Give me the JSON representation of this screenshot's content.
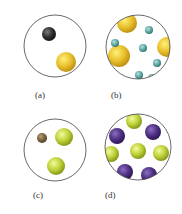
{
  "panels": [
    {
      "label": "(a)",
      "circle": {
        "cx": 55,
        "cy": 46,
        "r": 31
      },
      "label_pos": {
        "x": 35,
        "y": 98
      },
      "particles": [
        {
          "cx": 49,
          "cy": 34,
          "r": 7,
          "color": "dark"
        },
        {
          "cx": 66,
          "cy": 62,
          "r": 10,
          "color": "gold"
        }
      ]
    },
    {
      "label": "(b)",
      "circle": {
        "cx": 138,
        "cy": 47,
        "r": 32
      },
      "label_pos": {
        "x": 111,
        "y": 98
      },
      "particles": [
        {
          "cx": 127,
          "cy": 23,
          "r": 10,
          "color": "gold"
        },
        {
          "cx": 119,
          "cy": 56,
          "r": 11,
          "color": "gold"
        },
        {
          "cx": 167,
          "cy": 47,
          "r": 10,
          "color": "gold"
        },
        {
          "cx": 149,
          "cy": 30,
          "r": 4,
          "color": "teal"
        },
        {
          "cx": 115,
          "cy": 43,
          "r": 4,
          "color": "teal"
        },
        {
          "cx": 143,
          "cy": 48,
          "r": 4,
          "color": "teal"
        },
        {
          "cx": 157,
          "cy": 63,
          "r": 4,
          "color": "teal"
        },
        {
          "cx": 139,
          "cy": 75,
          "r": 4,
          "color": "teal"
        },
        {
          "cx": 152,
          "cy": 78,
          "r": 4,
          "color": "teal"
        }
      ]
    },
    {
      "label": "(c)",
      "circle": {
        "cx": 55,
        "cy": 150,
        "r": 31
      },
      "label_pos": {
        "x": 33,
        "y": 198
      },
      "particles": [
        {
          "cx": 42,
          "cy": 138,
          "r": 5,
          "color": "brown"
        },
        {
          "cx": 64,
          "cy": 137,
          "r": 9,
          "color": "lime"
        },
        {
          "cx": 56,
          "cy": 166,
          "r": 9,
          "color": "lime"
        }
      ]
    },
    {
      "label": "(d)",
      "circle": {
        "cx": 138,
        "cy": 147,
        "r": 33
      },
      "label_pos": {
        "x": 105,
        "y": 198
      },
      "particles": [
        {
          "cx": 134,
          "cy": 121,
          "r": 8,
          "color": "lime"
        },
        {
          "cx": 117,
          "cy": 136,
          "r": 8,
          "color": "purple"
        },
        {
          "cx": 153,
          "cy": 132,
          "r": 8,
          "color": "purple"
        },
        {
          "cx": 111,
          "cy": 154,
          "r": 8,
          "color": "lime"
        },
        {
          "cx": 138,
          "cy": 151,
          "r": 8,
          "color": "lime"
        },
        {
          "cx": 161,
          "cy": 153,
          "r": 8,
          "color": "lime"
        },
        {
          "cx": 125,
          "cy": 172,
          "r": 8,
          "color": "purple"
        },
        {
          "cx": 149,
          "cy": 175,
          "r": 8,
          "color": "purple"
        }
      ]
    }
  ],
  "colors": {
    "dark": {
      "light": "#7a7a7a",
      "base": "#2f2f2f",
      "edge": "#111111"
    },
    "gold": {
      "light": "#fff07a",
      "base": "#e8bf2a",
      "edge": "#b98a10"
    },
    "teal": {
      "light": "#b7e0dc",
      "base": "#5fa8a3",
      "edge": "#2f6f6b"
    },
    "brown": {
      "light": "#b8a070",
      "base": "#7a6440",
      "edge": "#4a3a20"
    },
    "lime": {
      "light": "#f4fa9a",
      "base": "#bcd037",
      "edge": "#7d8f12"
    },
    "purple": {
      "light": "#8c6fc0",
      "base": "#4d2f82",
      "edge": "#2a1550"
    }
  },
  "outline_color": "#444444"
}
